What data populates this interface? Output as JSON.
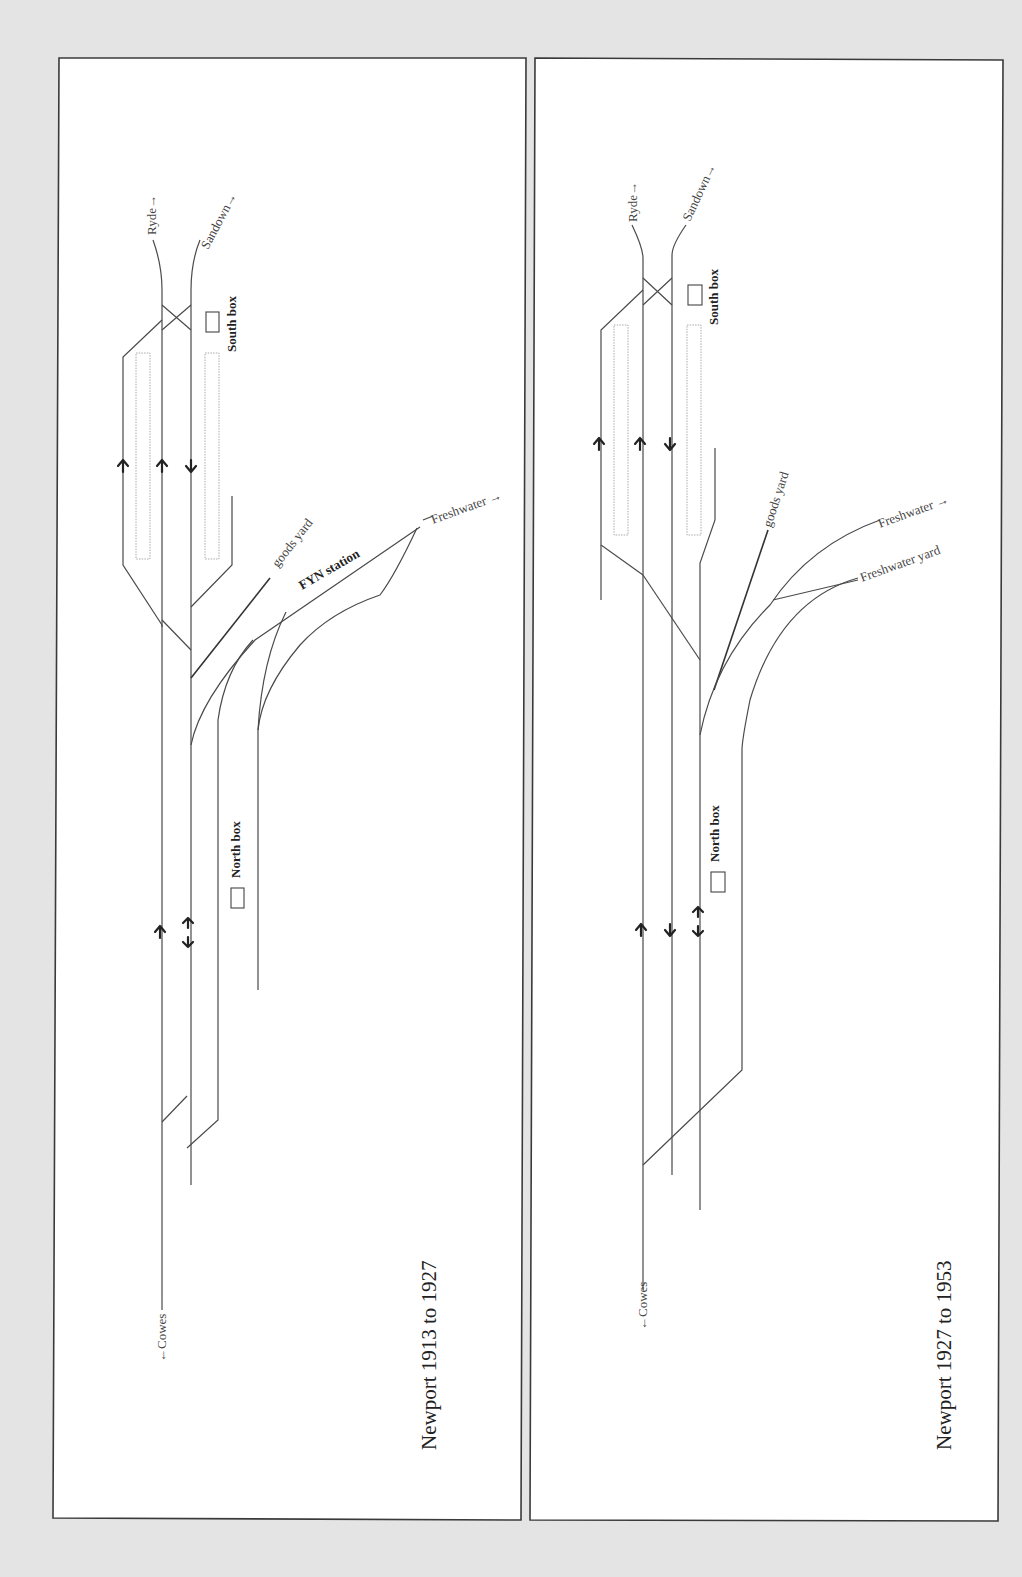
{
  "page": {
    "background": "#e4e4e4",
    "line_color": "#4a4a4a"
  },
  "panels": [
    {
      "title": "Newport 1913 to 1927",
      "labels": {
        "ryde": "Ryde",
        "sandown": "Sandown",
        "south_box": "South box",
        "goods_yard": "goods yard",
        "fyn_station": "FYN station",
        "freshwater": "Freshwater",
        "north_box": "North box",
        "cowes": "Cowes"
      },
      "direction_arrows": [
        "up",
        "up",
        "down",
        "up",
        "up-down"
      ]
    },
    {
      "title": "Newport 1927 to 1953",
      "labels": {
        "ryde": "Ryde",
        "sandown": "Sandown",
        "south_box": "South box",
        "goods_yard": "goods yard",
        "freshwater": "Freshwater",
        "freshwater_yard": "Freshwater yard",
        "north_box": "North box",
        "cowes": "Cowes"
      },
      "direction_arrows": [
        "up",
        "up",
        "down",
        "up",
        "down",
        "up-down"
      ]
    }
  ],
  "glyphs": {
    "arrow_right": "→",
    "arrow_left": "←"
  }
}
